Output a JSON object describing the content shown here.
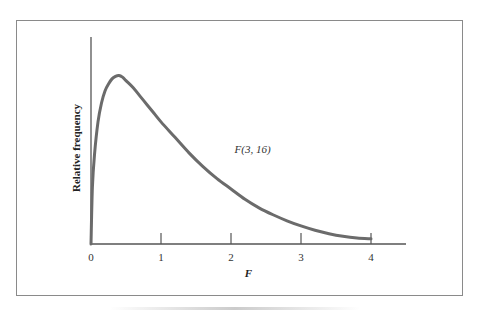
{
  "chart_data": {
    "type": "line",
    "title": "",
    "xlabel": "F",
    "ylabel": "Relative frequency",
    "xlim": [
      0,
      4.5
    ],
    "ylim": [
      0,
      1.0
    ],
    "x_ticks": [
      0,
      1,
      2,
      3,
      4
    ],
    "x_tick_labels": [
      "0",
      "1",
      "2",
      "3",
      "4"
    ],
    "y_ticks": [],
    "grid": false,
    "legend": "none",
    "annotations": [
      {
        "text": "F(3, 16)",
        "x": 2.05,
        "y": 0.55
      }
    ],
    "series": [
      {
        "name": "F(3, 16)",
        "color": "#6b6b6b",
        "x": [
          0,
          0.02,
          0.05,
          0.1,
          0.15,
          0.2,
          0.25,
          0.3,
          0.35,
          0.4,
          0.45,
          0.5,
          0.6,
          0.7,
          0.8,
          0.9,
          1.0,
          1.2,
          1.4,
          1.6,
          1.8,
          2.0,
          2.2,
          2.4,
          2.6,
          2.8,
          3.0,
          3.2,
          3.4,
          3.6,
          3.8,
          4.0
        ],
        "y": [
          0,
          0.33,
          0.52,
          0.71,
          0.82,
          0.89,
          0.93,
          0.96,
          0.975,
          0.98,
          0.97,
          0.95,
          0.91,
          0.86,
          0.81,
          0.76,
          0.71,
          0.62,
          0.53,
          0.45,
          0.38,
          0.32,
          0.26,
          0.21,
          0.17,
          0.135,
          0.105,
          0.08,
          0.06,
          0.045,
          0.035,
          0.03
        ]
      }
    ]
  }
}
